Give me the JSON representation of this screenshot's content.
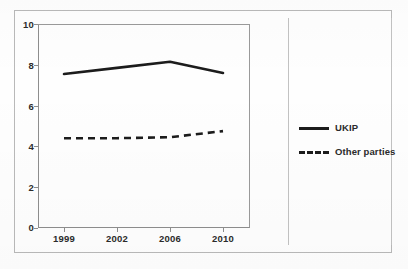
{
  "chart_data": {
    "type": "line",
    "title": "",
    "subtitle": "",
    "xlabel": "",
    "ylabel": "",
    "categories": [
      "1999",
      "2002",
      "2006",
      "2010"
    ],
    "ylim": [
      0,
      10
    ],
    "yticks": [
      "0",
      "2",
      "4",
      "6",
      "8",
      "10"
    ],
    "grid": false,
    "legend_position": "right",
    "series": [
      {
        "name": "UKIP",
        "style": "solid",
        "color": "#1c1c1c",
        "values": [
          7.55,
          7.85,
          8.15,
          7.6
        ]
      },
      {
        "name": "Other parties",
        "style": "dashed",
        "color": "#1c1c1c",
        "values": [
          4.4,
          4.4,
          4.45,
          4.75
        ]
      }
    ]
  },
  "legend": {
    "entries": [
      {
        "label": "UKIP"
      },
      {
        "label": "Other parties"
      }
    ]
  },
  "axes": {
    "y_tick_labels": [
      "10",
      "8",
      "6",
      "4",
      "2",
      "0"
    ],
    "x_tick_labels": [
      "1999",
      "2002",
      "2006",
      "2010"
    ]
  }
}
